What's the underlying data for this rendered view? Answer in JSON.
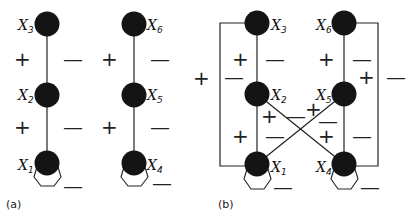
{
  "panels": {
    "a": {
      "caption": "(a)",
      "nodes": [
        {
          "id": "x1",
          "label": "X",
          "sub": "1"
        },
        {
          "id": "x2",
          "label": "X",
          "sub": "2"
        },
        {
          "id": "x3",
          "label": "X",
          "sub": "3"
        },
        {
          "id": "x4",
          "label": "X",
          "sub": "4"
        },
        {
          "id": "x5",
          "label": "X",
          "sub": "5"
        },
        {
          "id": "x6",
          "label": "X",
          "sub": "6"
        }
      ],
      "signs": {
        "left_upper_plus": "+",
        "left_upper_minus": "—",
        "left_lower_plus": "+",
        "left_lower_minus": "—",
        "left_self_minus": "—",
        "right_upper_plus": "+",
        "right_upper_minus": "—",
        "right_lower_plus": "+",
        "right_lower_minus": "—",
        "right_self_minus": "—"
      }
    },
    "b": {
      "caption": "(b)",
      "nodes": [
        {
          "id": "x1",
          "label": "X",
          "sub": "1"
        },
        {
          "id": "x2",
          "label": "X",
          "sub": "2"
        },
        {
          "id": "x3",
          "label": "X",
          "sub": "3"
        },
        {
          "id": "x4",
          "label": "X",
          "sub": "4"
        },
        {
          "id": "x5",
          "label": "X",
          "sub": "5"
        },
        {
          "id": "x6",
          "label": "X",
          "sub": "6"
        }
      ],
      "signs": {
        "outer_left_plus": "+",
        "outer_left_minus": "—",
        "left_upper_plus": "+",
        "left_upper_minus": "—",
        "left_lower_plus": "+",
        "left_lower_minus": "—",
        "cross_x2_plus": "+",
        "cross_mid_minus": "—",
        "cross_x5_plus": "+",
        "cross_x5_minus": "—",
        "right_upper_plus": "+",
        "right_upper_minus": "—",
        "right_lower_plus": "+",
        "right_lower_minus": "—",
        "outer_right_plus": "+",
        "outer_right_minus": "—",
        "left_self_minus": "—",
        "right_self_minus": "—"
      }
    }
  }
}
